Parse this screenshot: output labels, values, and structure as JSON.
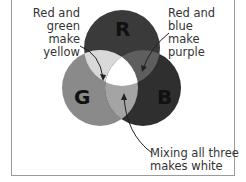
{
  "diagram": {
    "circles": [
      {
        "id": "red",
        "letter": "R",
        "color": "#3a3a3a"
      },
      {
        "id": "green",
        "letter": "G",
        "color": "#8a8a8a"
      },
      {
        "id": "blue",
        "letter": "B",
        "color": "#2f2f2f"
      }
    ],
    "overlaps": {
      "red_green": "#d9d9d9",
      "red_blue": "#5e5e5e",
      "green_blue": "#a4a4a4",
      "center": "#ffffff"
    },
    "annotations": {
      "yellow": [
        "Red and",
        "green make",
        "yellow"
      ],
      "purple": [
        "Red and blue",
        "make purple"
      ],
      "white": [
        "Mixing all three",
        "makes white"
      ]
    }
  }
}
